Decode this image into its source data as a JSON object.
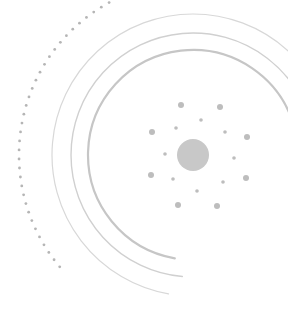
{
  "graphic": {
    "description": "decorative radial illustration",
    "colors": {
      "background": "#ffffff",
      "arc_light": "#d6d6d6",
      "arc_mid": "#c4c4c4",
      "dots": "#bdbdbd",
      "core": "#c8c8c8"
    },
    "center": {
      "x": 193,
      "y": 155
    },
    "core_radius": 16,
    "arcs": [
      {
        "r": 141,
        "width": 1.2,
        "color": "#d8d8d8",
        "start_deg": 100,
        "end_deg": 355
      },
      {
        "r": 122,
        "width": 1.4,
        "color": "#d0d0d0",
        "start_deg": 95,
        "end_deg": 350
      },
      {
        "r": 105,
        "width": 2.2,
        "color": "#c6c6c6",
        "start_deg": 100,
        "end_deg": 345
      }
    ],
    "dotted_arc": {
      "r": 174,
      "start_deg": 140,
      "end_deg": 262,
      "count": 42,
      "dot_r": 1.4,
      "color": "#b5b5b5"
    },
    "satellite_dots": [
      {
        "x": 181,
        "y": 105,
        "r": 3
      },
      {
        "x": 220,
        "y": 107,
        "r": 3
      },
      {
        "x": 201,
        "y": 120,
        "r": 1.8
      },
      {
        "x": 176,
        "y": 128,
        "r": 1.8
      },
      {
        "x": 225,
        "y": 132,
        "r": 1.8
      },
      {
        "x": 152,
        "y": 132,
        "r": 3
      },
      {
        "x": 247,
        "y": 137,
        "r": 3
      },
      {
        "x": 165,
        "y": 154,
        "r": 1.8
      },
      {
        "x": 234,
        "y": 158,
        "r": 1.8
      },
      {
        "x": 151,
        "y": 175,
        "r": 3
      },
      {
        "x": 246,
        "y": 178,
        "r": 3
      },
      {
        "x": 173,
        "y": 179,
        "r": 1.8
      },
      {
        "x": 223,
        "y": 182,
        "r": 1.8
      },
      {
        "x": 197,
        "y": 191,
        "r": 1.8
      },
      {
        "x": 178,
        "y": 205,
        "r": 3
      },
      {
        "x": 217,
        "y": 206,
        "r": 3
      }
    ],
    "top_ghost_arcs": [
      {
        "x1": 60,
        "y1": 2,
        "x2": 100,
        "y2": 0
      }
    ]
  }
}
